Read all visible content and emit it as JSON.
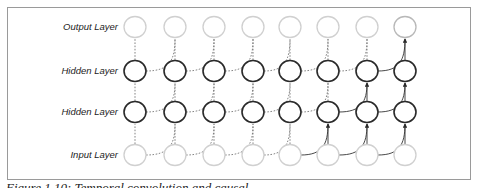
{
  "diagram": {
    "type": "temporal convolution network",
    "layers": [
      {
        "name": "Output Layer",
        "y": 27,
        "style": "faded"
      },
      {
        "name": "Hidden Layer",
        "y": 71,
        "style": "dark"
      },
      {
        "name": "Hidden Layer",
        "y": 112,
        "style": "dark"
      },
      {
        "name": "Input Layer",
        "y": 155,
        "style": "faded"
      }
    ],
    "columns_x": [
      135,
      175,
      214,
      253,
      290,
      328,
      367,
      405
    ],
    "node_radius": 11,
    "colors": {
      "faded_node": "#d0d0d0",
      "dark_node": "#2a2a2a",
      "dashed_edge": "#777777",
      "solid_edge": "#333333",
      "frame": "#9a9a9a"
    },
    "highlighted_output_index": 7
  },
  "labels": {
    "output": "Output Layer",
    "hidden2": "Hidden Layer",
    "hidden1": "Hidden Layer",
    "input": "Input Layer"
  },
  "caption": "Figure 1.10: Temporal convolution and causal ..."
}
